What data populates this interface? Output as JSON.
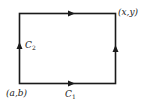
{
  "diagram": {
    "type": "path-integration-rectangle",
    "stroke_color": "#1a1a1a",
    "labels": {
      "start_point": "(a,b)",
      "end_point": "(x,y)",
      "c1_main": "C",
      "c1_sub": "1",
      "c2_main": "C",
      "c2_sub": "2"
    },
    "edges": [
      {
        "name": "bottom",
        "direction": "right",
        "label": "C1"
      },
      {
        "name": "right",
        "direction": "up"
      },
      {
        "name": "top",
        "direction": "right"
      },
      {
        "name": "left",
        "direction": "up",
        "label": "C2"
      }
    ]
  }
}
